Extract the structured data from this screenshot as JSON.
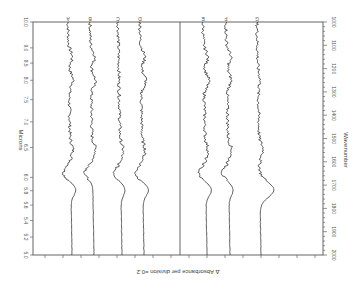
{
  "chart_data": {
    "type": "line",
    "title": "",
    "orientation": "rotated-90",
    "xlabel_top": "Microns",
    "xlabel_bottom": "Wavenumber",
    "ylabel": "Δ Absorbance per division =0.2",
    "micron_ticks": [
      "5.0",
      "5.2",
      "5.4",
      "5.6",
      "5.8",
      "6.0",
      "6.5",
      "7.0",
      "7.5",
      "8.0",
      "8.5",
      "9.0",
      "10.0"
    ],
    "wavenumber_ticks": [
      "2000",
      "1900",
      "1800",
      "1700",
      "1600",
      "1500",
      "1400",
      "1300",
      "1200",
      "1100",
      "1000"
    ],
    "xlim_wavenumber": [
      2000,
      1000
    ],
    "series": [
      {
        "name": "A",
        "baseline_x": 68,
        "features": [
          [
            1720,
            0.35
          ],
          [
            1650,
            -0.5
          ],
          [
            1550,
            0.2
          ],
          [
            1250,
            0.3
          ],
          [
            1150,
            0.25
          ]
        ]
      },
      {
        "name": "B",
        "baseline_x": 90,
        "features": [
          [
            1650,
            -0.55
          ],
          [
            1550,
            0.25
          ],
          [
            1250,
            0.3
          ],
          [
            1150,
            0.3
          ]
        ]
      },
      {
        "name": "C",
        "baseline_x": 118,
        "features": [
          [
            1720,
            0.3
          ],
          [
            1650,
            -0.45
          ],
          [
            1550,
            0.2
          ]
        ]
      },
      {
        "name": "D",
        "baseline_x": 140,
        "features": [
          [
            1720,
            0.4
          ],
          [
            1650,
            -0.5
          ],
          [
            1550,
            0.2
          ],
          [
            1250,
            0.35
          ],
          [
            1150,
            0.3
          ]
        ]
      },
      {
        "name": "E",
        "baseline_x": 203,
        "features": [
          [
            1720,
            0.4
          ],
          [
            1650,
            -0.5
          ],
          [
            1550,
            0.2
          ],
          [
            1250,
            0.35
          ],
          [
            1150,
            0.3
          ]
        ]
      },
      {
        "name": "F",
        "baseline_x": 226,
        "features": [
          [
            1720,
            0.3
          ],
          [
            1650,
            -0.45
          ],
          [
            1550,
            0.25
          ],
          [
            1250,
            0.3
          ],
          [
            1150,
            0.3
          ]
        ]
      },
      {
        "name": "G",
        "baseline_x": 257,
        "features": [
          [
            1720,
            1.0
          ],
          [
            1550,
            0.3
          ],
          [
            1250,
            0.15
          ]
        ]
      }
    ],
    "grid": false,
    "legend": "letters-at-top"
  }
}
